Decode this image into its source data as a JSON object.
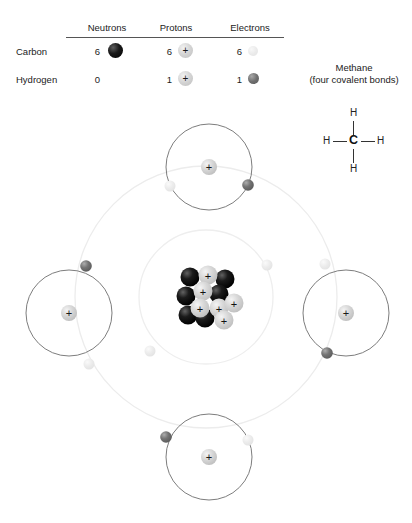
{
  "legend": {
    "columns": [
      "Neutrons",
      "Protons",
      "Electrons"
    ],
    "rows": [
      {
        "label": "Carbon",
        "neutrons": "6",
        "protons": "6",
        "electrons": "6",
        "neutron_glyph": "neutron-sphere",
        "proton_glyph": "proton-sphere-plus",
        "electron_glyph": "electron-sphere-light"
      },
      {
        "label": "Hydrogen",
        "neutrons": "0",
        "protons": "1",
        "electrons": "1",
        "neutron_glyph": "none",
        "proton_glyph": "proton-sphere-plus",
        "electron_glyph": "electron-sphere-dark"
      }
    ],
    "proton_symbol": "+"
  },
  "methane": {
    "title": "Methane",
    "subtitle": "(four covalent bonds)",
    "structure": {
      "center_atom": "C",
      "top_atom": "H",
      "left_atom": "H",
      "right_atom": "H",
      "bottom_atom": "H"
    }
  },
  "atom_diagram": {
    "nucleus": {
      "neutron_count": 6,
      "proton_count": 6,
      "proton_symbol": "+"
    },
    "carbon_shells": {
      "inner_shell_electrons": 2,
      "outer_shell_electrons": 4
    },
    "hydrogens": [
      {
        "position": "top",
        "proton_symbol": "+",
        "electrons": 2
      },
      {
        "position": "left",
        "proton_symbol": "+",
        "electrons": 2
      },
      {
        "position": "right",
        "proton_symbol": "+",
        "electrons": 2
      },
      {
        "position": "bottom",
        "proton_symbol": "+",
        "electrons": 2
      }
    ]
  },
  "colors": {
    "neutron": "#000000",
    "proton": "#d6d6d6",
    "electron_carbon": "#e8e8e8",
    "electron_hydrogen": "#666666",
    "shell_line": "#ededed",
    "hydrogen_ring_line": "#6a6a6a",
    "text": "#222222",
    "background": "#ffffff"
  }
}
